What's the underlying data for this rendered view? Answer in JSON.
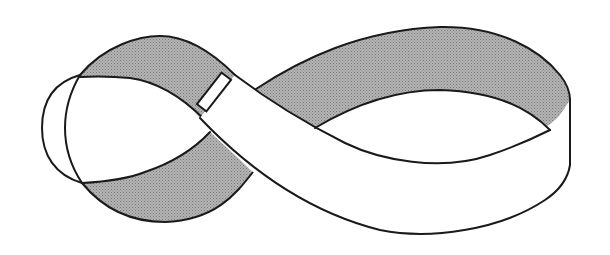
{
  "figure": {
    "subject": "twisted band",
    "colors": {
      "outline": "#1a1a1a",
      "shaded_surface": "#a8a8a8",
      "unshaded_surface": "#ffffff",
      "background": "#ffffff"
    },
    "parts": [
      "left-loop",
      "left-end-cap",
      "central-crossing",
      "seam-clasp",
      "right-loop",
      "right-end-edge"
    ]
  }
}
